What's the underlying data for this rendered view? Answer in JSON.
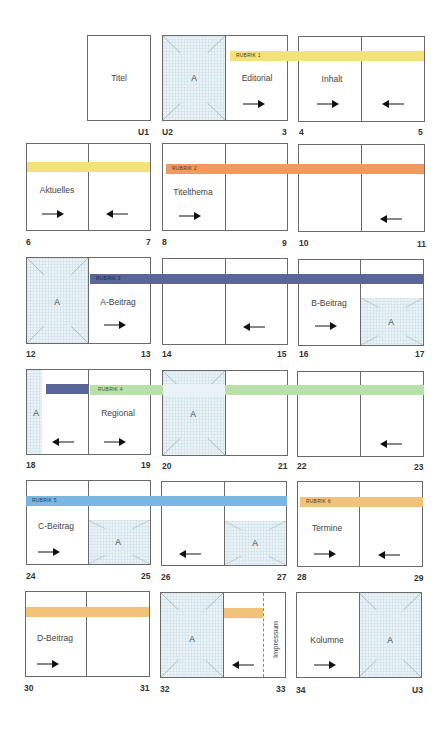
{
  "diagram": {
    "type": "magazine-flatplan",
    "colors": {
      "rubrik1": "#f3e27a",
      "rubrik2": "#ef9a63",
      "rubrik3": "#5a6699",
      "rubrik4": "#b8e0a8",
      "rubrik5": "#7ab7e0",
      "rubrik6": "#f3c27a",
      "ad_tint": "#e9f3f7",
      "border": "#6a6a6a"
    },
    "rubriks": [
      "RUBRIK 1",
      "RUBRIK 2",
      "RUBRIK 3",
      "RUBRIK 4",
      "RUBRIK 5",
      "RUBRIK 6"
    ],
    "ad_label": "A",
    "rows": [
      {
        "spreads": [
          {
            "left_num": "",
            "right_num": "U1",
            "left": "",
            "right": "Titel"
          },
          {
            "left_num": "U2",
            "right_num": "3",
            "left": "A",
            "right": "Editorial"
          },
          {
            "left_num": "4",
            "right_num": "5",
            "left": "Inhalt",
            "right": ""
          }
        ]
      },
      {
        "spreads": [
          {
            "left_num": "6",
            "right_num": "7",
            "left": "Aktuelles",
            "right": ""
          },
          {
            "left_num": "8",
            "right_num": "9",
            "left": "Titelthema",
            "right": ""
          },
          {
            "left_num": "10",
            "right_num": "11",
            "left": "",
            "right": ""
          }
        ]
      },
      {
        "spreads": [
          {
            "left_num": "12",
            "right_num": "13",
            "left": "A",
            "right": "A-Beitrag"
          },
          {
            "left_num": "14",
            "right_num": "15",
            "left": "",
            "right": ""
          },
          {
            "left_num": "16",
            "right_num": "17",
            "left": "B-Beitrag",
            "right": "A"
          }
        ]
      },
      {
        "spreads": [
          {
            "left_num": "18",
            "right_num": "19",
            "left": "A",
            "right": "Regional"
          },
          {
            "left_num": "20",
            "right_num": "21",
            "left": "A",
            "right": ""
          },
          {
            "left_num": "22",
            "right_num": "23",
            "left": "",
            "right": ""
          }
        ]
      },
      {
        "spreads": [
          {
            "left_num": "24",
            "right_num": "25",
            "left": "C-Beitrag",
            "right": "A"
          },
          {
            "left_num": "26",
            "right_num": "27",
            "left": "",
            "right": "A"
          },
          {
            "left_num": "28",
            "right_num": "29",
            "left": "Termine",
            "right": ""
          }
        ]
      },
      {
        "spreads": [
          {
            "left_num": "30",
            "right_num": "31",
            "left": "D-Beitrag",
            "right": ""
          },
          {
            "left_num": "32",
            "right_num": "33",
            "left": "A",
            "right": "Impressum"
          },
          {
            "left_num": "34",
            "right_num": "U3",
            "left": "Kolumne",
            "right": "A"
          }
        ]
      }
    ]
  }
}
